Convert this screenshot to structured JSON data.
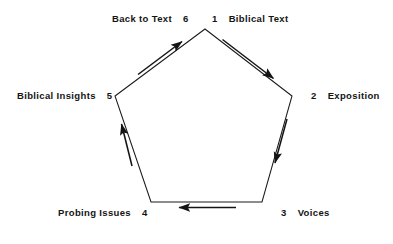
{
  "diagram": {
    "shape": "pentagon",
    "stroke_color": "#1a1a1a",
    "background_color": "#ffffff",
    "flow_direction": "clockwise",
    "nodes": [
      {
        "number": "1",
        "label": "Biblical Text",
        "position": "top-right",
        "num_first": true
      },
      {
        "number": "2",
        "label": "Exposition",
        "position": "right",
        "num_first": true
      },
      {
        "number": "3",
        "label": "Voices",
        "position": "bottom-right",
        "num_first": true
      },
      {
        "number": "4",
        "label": "Probing Issues",
        "position": "bottom-left",
        "num_first": false
      },
      {
        "number": "5",
        "label": "Biblical Insights",
        "position": "left",
        "num_first": false
      },
      {
        "number": "6",
        "label": "Back to Text",
        "position": "top-left",
        "num_first": false
      }
    ],
    "edges": [
      {
        "from": "1",
        "to": "2",
        "direction": "down-right"
      },
      {
        "from": "2",
        "to": "3",
        "direction": "down"
      },
      {
        "from": "3",
        "to": "4",
        "direction": "left"
      },
      {
        "from": "4",
        "to": "5",
        "direction": "up"
      },
      {
        "from": "5",
        "to": "6",
        "direction": "up-right"
      }
    ]
  }
}
